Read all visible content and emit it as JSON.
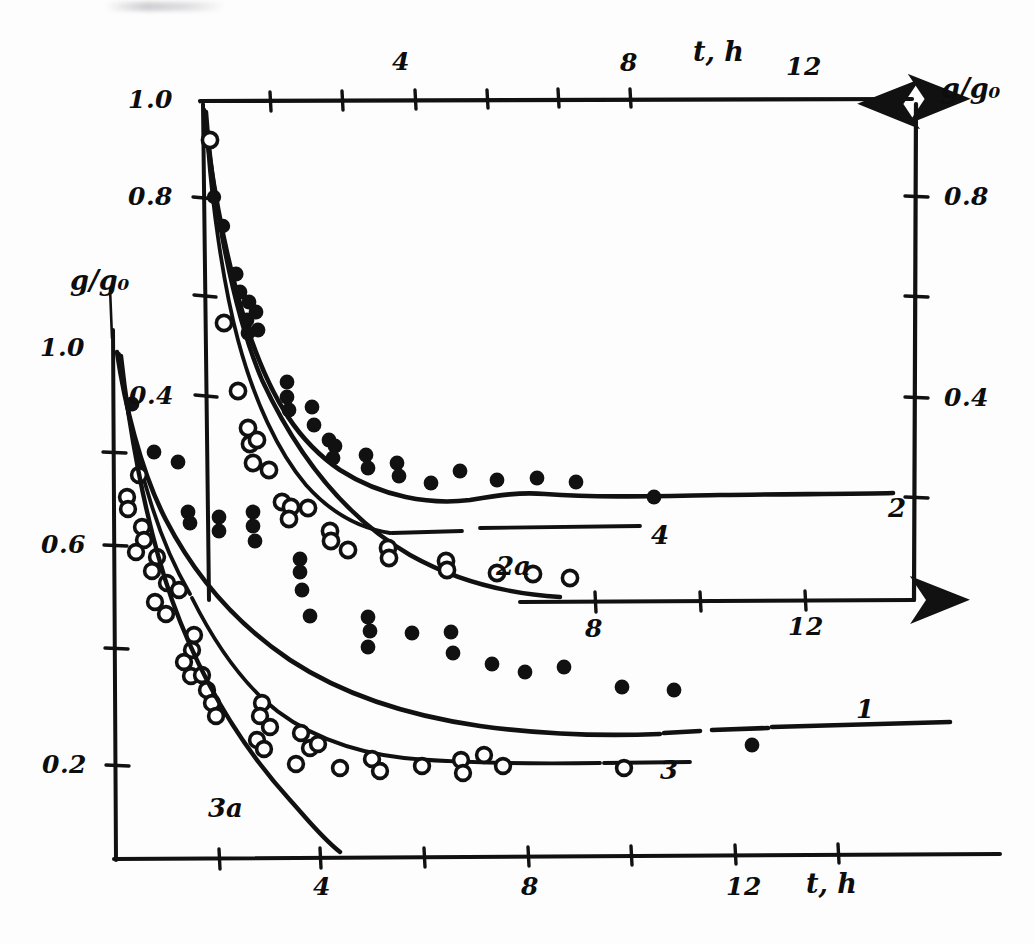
{
  "figure": {
    "kind": "hand-drawn scientific plot, two superimposed decay panels",
    "ink_color": "#111111",
    "paper_color": "#fdfdfd"
  },
  "axis_labels": {
    "upper_y": "g/g₀",
    "upper_x": "t, h",
    "lower_y": "g/g₀",
    "lower_x": "t, h"
  },
  "curve_labels": {
    "c1": "1",
    "c2": "2",
    "c3": "3",
    "c4": "4",
    "c2a": "2a",
    "c3a": "3a"
  },
  "upper_panel": {
    "y_ticks_labeled": [
      "1.0",
      "0.8",
      "0.4"
    ],
    "y_ticks_right_labeled": [
      "0.8",
      "0.4"
    ],
    "x_ticks_top_labeled": [
      "4",
      "8",
      "12"
    ],
    "x_ticks_bottom_labeled": [
      "8",
      "12"
    ]
  },
  "lower_panel": {
    "y_ticks_labeled": [
      "1.0",
      "0.6",
      "0.2"
    ],
    "x_ticks_labeled": [
      "4",
      "8",
      "12"
    ]
  },
  "chart_data": {
    "type": "scatter",
    "title": "",
    "subtitle": "",
    "xlabel": "t, h",
    "ylabel": "g/g₀",
    "grid": false,
    "legend_position": "inline curve end labels",
    "panels": [
      {
        "name": "upper",
        "xlim": [
          0,
          14
        ],
        "ylim": [
          0,
          1.0
        ],
        "x_axis_top": {
          "ticks": [
            0,
            2,
            4,
            6,
            8,
            10,
            12
          ],
          "labeled": {
            "4": "4",
            "8": "8",
            "12": "12"
          },
          "label": "t, h",
          "arrow": "right"
        },
        "x_axis_bottom": {
          "ticks": [
            8,
            10,
            12
          ],
          "labeled": {
            "8": "8",
            "12": "12"
          },
          "arrow": "right"
        },
        "y_axis_left": {
          "ticks": [
            1.0,
            0.8,
            0.6,
            0.4
          ],
          "labeled": {
            "1.0": "1.0",
            "0.8": "0.8",
            "0.4": "0.4"
          }
        },
        "y_axis_right": {
          "ticks": [
            1.0,
            0.8,
            0.6,
            0.4,
            0.2
          ],
          "labeled": {
            "0.8": "0.8",
            "0.4": "0.4"
          },
          "label": "g/g₀",
          "arrow": "up"
        },
        "series": [
          {
            "name": "2",
            "marker": "filled-circle",
            "label_at": [
              13.2,
              0.175
            ],
            "points": [
              [
                0.3,
                0.8
              ],
              [
                0.55,
                0.745
              ],
              [
                0.9,
                0.655
              ],
              [
                1.0,
                0.62
              ],
              [
                1.25,
                0.6
              ],
              [
                1.2,
                0.565
              ],
              [
                1.22,
                0.54
              ],
              [
                1.45,
                0.58
              ],
              [
                1.5,
                0.545
              ],
              [
                2.3,
                0.445
              ],
              [
                2.3,
                0.415
              ],
              [
                2.35,
                0.39
              ],
              [
                2.95,
                0.395
              ],
              [
                3.0,
                0.36
              ],
              [
                3.4,
                0.33
              ],
              [
                3.55,
                0.318
              ],
              [
                3.5,
                0.295
              ],
              [
                4.4,
                0.3
              ],
              [
                4.45,
                0.275
              ],
              [
                5.2,
                0.285
              ],
              [
                5.25,
                0.258
              ],
              [
                6.1,
                0.245
              ],
              [
                6.9,
                0.268
              ],
              [
                7.9,
                0.25
              ],
              [
                9.0,
                0.255
              ],
              [
                9.95,
                0.248
              ],
              [
                12.1,
                0.218
              ]
            ],
            "fit_curve": "monotone decay from 1.0 to plateau ~0.24"
          },
          {
            "name": "2a",
            "marker": "none",
            "label_at": [
              6.6,
              0.115
            ],
            "fit_curve": "steeper decay from 1.0 to plateau ~0.02 by t=7"
          },
          {
            "name": "4",
            "marker": "open-circle",
            "label_at": [
              9.1,
              0.185
            ],
            "points": [
              [
                0.12,
                0.915
              ],
              [
                0.55,
                0.62
              ],
              [
                0.95,
                0.48
              ],
              [
                1.2,
                0.405
              ],
              [
                1.25,
                0.388
              ],
              [
                1.4,
                0.392
              ],
              [
                1.3,
                0.352
              ],
              [
                1.75,
                0.338
              ],
              [
                2.1,
                0.275
              ],
              [
                2.35,
                0.265
              ],
              [
                2.3,
                0.24
              ],
              [
                2.8,
                0.262
              ],
              [
                3.4,
                0.215
              ],
              [
                3.45,
                0.195
              ],
              [
                3.9,
                0.178
              ],
              [
                5.0,
                0.18
              ],
              [
                5.05,
                0.16
              ],
              [
                6.6,
                0.155
              ],
              [
                6.65,
                0.138
              ],
              [
                8.0,
                0.132
              ],
              [
                9.0,
                0.13
              ],
              [
                10.0,
                0.126
              ]
            ],
            "fit_curve": "decay to plateau ~0.15, horizontal tail"
          }
        ]
      },
      {
        "name": "lower",
        "xlim": [
          0,
          14
        ],
        "ylim": [
          0,
          1.0
        ],
        "x_axis_bottom": {
          "ticks": [
            0,
            2,
            4,
            6,
            8,
            10,
            12
          ],
          "labeled": {
            "4": "4",
            "8": "8",
            "12": "12"
          },
          "label": "t, h"
        },
        "y_axis_left": {
          "ticks": [
            1.0,
            0.8,
            0.6,
            0.4,
            0.2
          ],
          "labeled": {
            "1.0": "1.0",
            "0.6": "0.6",
            "0.2": "0.2"
          },
          "label": "g/g₀"
        },
        "series": [
          {
            "name": "1",
            "marker": "filled-circle",
            "label_at": [
              12.9,
              0.255
            ],
            "points": [
              [
                0.35,
                0.805
              ],
              [
                0.8,
                0.715
              ],
              [
                1.25,
                0.695
              ],
              [
                1.45,
                0.6
              ],
              [
                1.5,
                0.578
              ],
              [
                2.05,
                0.59
              ],
              [
                2.05,
                0.562
              ],
              [
                2.7,
                0.6
              ],
              [
                2.7,
                0.575
              ],
              [
                2.75,
                0.545
              ],
              [
                3.6,
                0.51
              ],
              [
                3.6,
                0.485
              ],
              [
                3.65,
                0.45
              ],
              [
                3.8,
                0.4
              ],
              [
                4.9,
                0.398
              ],
              [
                4.95,
                0.372
              ],
              [
                4.9,
                0.34
              ],
              [
                5.75,
                0.37
              ],
              [
                6.5,
                0.372
              ],
              [
                6.55,
                0.33
              ],
              [
                7.3,
                0.31
              ],
              [
                7.95,
                0.295
              ],
              [
                8.7,
                0.305
              ],
              [
                9.8,
                0.268
              ],
              [
                10.8,
                0.262
              ],
              [
                12.3,
                0.215
              ]
            ],
            "fit_curve": "decay from 1.0 to plateau ~0.25"
          },
          {
            "name": "3",
            "marker": "open-circle",
            "label_at": [
              10.6,
              0.178
            ],
            "points": [
              [
                0.45,
                0.69
              ],
              [
                0.8,
                0.65
              ],
              [
                0.85,
                0.628
              ],
              [
                1.2,
                0.598
              ],
              [
                1.25,
                0.575
              ],
              [
                1.2,
                0.545
              ],
              [
                1.5,
                0.538
              ],
              [
                1.3,
                0.505
              ],
              [
                1.85,
                0.48
              ],
              [
                1.9,
                0.46
              ],
              [
                1.7,
                0.438
              ],
              [
                2.05,
                0.432
              ],
              [
                2.65,
                0.36
              ],
              [
                2.7,
                0.332
              ],
              [
                2.6,
                0.312
              ],
              [
                3.35,
                0.3
              ],
              [
                3.4,
                0.278
              ],
              [
                3.35,
                0.258
              ],
              [
                3.3,
                0.232
              ],
              [
                4.05,
                0.245
              ],
              [
                4.2,
                0.218
              ],
              [
                4.35,
                0.212
              ],
              [
                4.05,
                0.198
              ],
              [
                5.05,
                0.21
              ],
              [
                5.1,
                0.195
              ],
              [
                5.2,
                0.2
              ],
              [
                6.15,
                0.2
              ],
              [
                6.9,
                0.212
              ],
              [
                7.05,
                0.196
              ],
              [
                9.9,
                0.195
              ]
            ],
            "fit_curve": "decay to plateau ~0.20"
          },
          {
            "name": "3a",
            "marker": "none",
            "label_at": [
              2.8,
              0.095
            ],
            "fit_curve": "steep decay from 1.0 to ~0 by t=4"
          }
        ]
      }
    ]
  }
}
